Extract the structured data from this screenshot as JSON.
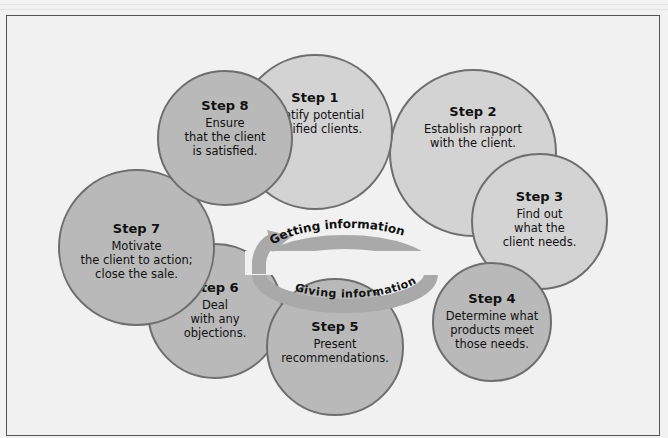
{
  "diagram": {
    "center": {
      "outer_label": "Getting information",
      "inner_label": "Giving information"
    },
    "steps": [
      {
        "title": "Step 1",
        "desc": "Identify potential\nqualified clients."
      },
      {
        "title": "Step 2",
        "desc": "Establish rapport\nwith the client."
      },
      {
        "title": "Step 3",
        "desc": "Find out\nwhat the\nclient needs."
      },
      {
        "title": "Step 4",
        "desc": "Determine what\nproducts meet\nthose needs."
      },
      {
        "title": "Step 5",
        "desc": "Present\nrecommendations."
      },
      {
        "title": "Step 6",
        "desc": "Deal\nwith any\nobjections."
      },
      {
        "title": "Step 7",
        "desc": "Motivate\nthe client to action;\nclose the sale."
      },
      {
        "title": "Step 8",
        "desc": "Ensure\nthat the client\nis satisfied."
      }
    ],
    "colors": {
      "circle_light": "#d3d3d3",
      "circle_dark": "#b9b9b9",
      "circle_border": "#6e6e6e",
      "arrow": "#a9a9a9",
      "background": "#f1f1f1"
    }
  }
}
